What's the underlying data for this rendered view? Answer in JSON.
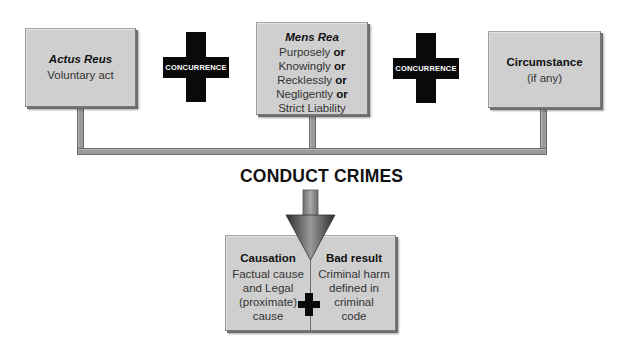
{
  "boxes": {
    "actus_reus": {
      "title": "Actus Reus",
      "lines": [
        "Voluntary act"
      ]
    },
    "mens_rea": {
      "title": "Mens Rea",
      "lines": [
        {
          "text": "Purposely",
          "conj": "or"
        },
        {
          "text": "Knowingly",
          "conj": "or"
        },
        {
          "text": "Recklessly",
          "conj": "or"
        },
        {
          "text": "Negligently",
          "conj": "or"
        },
        {
          "text": "Strict Liability",
          "conj": ""
        }
      ]
    },
    "circumstance": {
      "title": "Circumstance",
      "lines": [
        "(if any)"
      ]
    }
  },
  "connectors": [
    {
      "label": "CONCURRENCE"
    },
    {
      "label": "CONCURRENCE"
    }
  ],
  "main_title": "CONDUCT CRIMES",
  "result_box": {
    "left": {
      "title": "Causation",
      "lines": [
        "Factual cause",
        "and Legal",
        "(proximate)",
        "cause"
      ]
    },
    "right": {
      "title": "Bad result",
      "lines": [
        "Criminal harm",
        "defined in",
        "criminal",
        "code"
      ]
    }
  },
  "colors": {
    "box_fill": "#cfcfcf",
    "cross": "#0a0a0a",
    "pipe": "#9a9a9a"
  }
}
